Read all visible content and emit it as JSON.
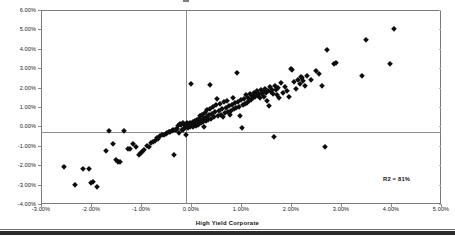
{
  "chart_data": {
    "type": "scatter",
    "title": "",
    "xlabel": "High Yield Corporate",
    "ylabel": "",
    "xlim": [
      -0.03,
      0.05
    ],
    "ylim": [
      -0.04,
      0.06
    ],
    "grid": false,
    "legend": null,
    "marker": "diamond",
    "marker_color": "#0d0d0d",
    "annotations": [
      {
        "text": "R2 = 81%",
        "x": 0.037,
        "y": -0.0295
      }
    ],
    "xticklabels": [
      "-3.00%",
      "-2.00%",
      "-1.00%",
      "0.00%",
      "1.00%",
      "2.00%",
      "3.00%",
      "4.00%",
      "5.00%"
    ],
    "xtickvalues": [
      -0.03,
      -0.02,
      -0.01,
      0.0,
      0.01,
      0.02,
      0.03,
      0.04,
      0.05
    ],
    "yticklabels": [
      "6.00%",
      "5.00%",
      "4.00%",
      "3.00%",
      "2.00%",
      "1.00%",
      "0.00%",
      "-1.00%",
      "-2.00%",
      "-3.00%",
      "-4.00%"
    ],
    "ytickvalues": [
      0.06,
      0.05,
      0.04,
      0.03,
      0.02,
      0.01,
      0.0,
      -0.01,
      -0.02,
      -0.03,
      -0.04
    ],
    "points": [
      [
        -0.0254,
        -0.0207
      ],
      [
        -0.0233,
        -0.0301
      ],
      [
        -0.0216,
        -0.0219
      ],
      [
        -0.0205,
        -0.0222
      ],
      [
        -0.0201,
        -0.0292
      ],
      [
        -0.0196,
        -0.0286
      ],
      [
        -0.0189,
        -0.031
      ],
      [
        -0.0171,
        -0.0126
      ],
      [
        -0.0164,
        -0.0025
      ],
      [
        -0.0157,
        -0.0093
      ],
      [
        -0.0151,
        -0.0175
      ],
      [
        -0.0147,
        -0.0181
      ],
      [
        -0.0142,
        -0.0183
      ],
      [
        -0.0134,
        -0.0024
      ],
      [
        -0.0127,
        -0.0114
      ],
      [
        -0.0122,
        -0.0117
      ],
      [
        -0.0116,
        -0.0093
      ],
      [
        -0.011,
        -0.0107
      ],
      [
        -0.0104,
        -0.0147
      ],
      [
        -0.0101,
        -0.0139
      ],
      [
        -0.0098,
        -0.0131
      ],
      [
        -0.0094,
        -0.012
      ],
      [
        -0.0089,
        -0.01
      ],
      [
        -0.0085,
        -0.0105
      ],
      [
        -0.0081,
        -0.0083
      ],
      [
        -0.0077,
        -0.0079
      ],
      [
        -0.0073,
        -0.0074
      ],
      [
        -0.0069,
        -0.006
      ],
      [
        -0.0066,
        -0.0063
      ],
      [
        -0.0062,
        -0.0052
      ],
      [
        -0.0058,
        -0.0046
      ],
      [
        -0.0055,
        -0.0044
      ],
      [
        -0.0051,
        -0.0039
      ],
      [
        -0.0048,
        -0.0035
      ],
      [
        -0.0045,
        -0.0031
      ],
      [
        -0.0042,
        -0.0029
      ],
      [
        -0.0039,
        -0.0024
      ],
      [
        -0.0036,
        -0.0021
      ],
      [
        -0.0034,
        -0.0148
      ],
      [
        -0.0033,
        -0.0019
      ],
      [
        -0.003,
        -0.0017
      ],
      [
        -0.0028,
        -0.0011
      ],
      [
        -0.0026,
        0.0002
      ],
      [
        -0.0025,
        -0.0034
      ],
      [
        -0.0023,
        0.0012
      ],
      [
        -0.0021,
        0.0006
      ],
      [
        -0.0019,
        -0.0021
      ],
      [
        -0.0017,
        0.0015
      ],
      [
        -0.0016,
        -0.0016
      ],
      [
        -0.0014,
        0.0009
      ],
      [
        -0.0013,
        -0.001
      ],
      [
        -0.0011,
        0.0004
      ],
      [
        -0.001,
        -0.0043
      ],
      [
        -0.0009,
        0.0019
      ],
      [
        -0.0008,
        0.0001
      ],
      [
        -0.0006,
        -0.0007
      ],
      [
        -0.0005,
        0.0011
      ],
      [
        -0.0004,
        0.0003
      ],
      [
        -0.0003,
        0.0016
      ],
      [
        -0.0002,
        -0.0004
      ],
      [
        -0.0001,
        0.0008
      ],
      [
        0.0,
        0.0218
      ],
      [
        0.0001,
        0.0013
      ],
      [
        0.0002,
        0.0002
      ],
      [
        0.0003,
        0.0021
      ],
      [
        0.0004,
        -0.0002
      ],
      [
        0.0005,
        0.0007
      ],
      [
        0.0006,
        0.0017
      ],
      [
        0.0007,
        0.001
      ],
      [
        0.0008,
        0.0026
      ],
      [
        0.0009,
        0.0004
      ],
      [
        0.001,
        0.0014
      ],
      [
        0.0011,
        0.0031
      ],
      [
        0.0012,
        0.0019
      ],
      [
        0.0013,
        0.0006
      ],
      [
        0.0014,
        0.0024
      ],
      [
        0.0015,
        0.004
      ],
      [
        0.0016,
        0.0011
      ],
      [
        0.0017,
        0.0029
      ],
      [
        0.0018,
        0.0052
      ],
      [
        0.0019,
        0.0016
      ],
      [
        0.002,
        0.0035
      ],
      [
        0.0022,
        0.0061
      ],
      [
        0.0023,
        0.0021
      ],
      [
        0.0025,
        0.0043
      ],
      [
        0.0026,
        -0.0004
      ],
      [
        0.0027,
        0.007
      ],
      [
        0.0029,
        0.0027
      ],
      [
        0.0031,
        0.005
      ],
      [
        0.0032,
        0.0085
      ],
      [
        0.0034,
        0.0033
      ],
      [
        0.0036,
        0.0057
      ],
      [
        0.0037,
        0.009
      ],
      [
        0.0038,
        0.0216
      ],
      [
        0.004,
        0.0039
      ],
      [
        0.0042,
        0.0064
      ],
      [
        0.0044,
        0.01
      ],
      [
        0.0046,
        0.0046
      ],
      [
        0.0048,
        0.0073
      ],
      [
        0.005,
        0.0109
      ],
      [
        0.0052,
        0.0141
      ],
      [
        0.0054,
        0.0053
      ],
      [
        0.0056,
        0.0081
      ],
      [
        0.0058,
        0.0116
      ],
      [
        0.006,
        0.006
      ],
      [
        0.0062,
        0.0089
      ],
      [
        0.0064,
        0.0046
      ],
      [
        0.0066,
        0.0124
      ],
      [
        0.0068,
        0.0067
      ],
      [
        0.007,
        0.0097
      ],
      [
        0.0072,
        0.0133
      ],
      [
        0.0074,
        0.0074
      ],
      [
        0.0076,
        0.0105
      ],
      [
        0.0078,
        0.0058
      ],
      [
        0.008,
        0.0081
      ],
      [
        0.0082,
        0.0112
      ],
      [
        0.0084,
        0.0148
      ],
      [
        0.0086,
        0.0088
      ],
      [
        0.0088,
        0.012
      ],
      [
        0.009,
        0.0095
      ],
      [
        0.0092,
        0.0273
      ],
      [
        0.0094,
        0.0127
      ],
      [
        0.0096,
        0.0102
      ],
      [
        0.0098,
        0.0052
      ],
      [
        0.01,
        0.0134
      ],
      [
        0.0102,
        -0.0009
      ],
      [
        0.0104,
        0.0109
      ],
      [
        0.0106,
        0.0141
      ],
      [
        0.0108,
        0.0116
      ],
      [
        0.011,
        0.016
      ],
      [
        0.0112,
        0.0123
      ],
      [
        0.0114,
        0.0148
      ],
      [
        0.0116,
        0.013
      ],
      [
        0.0118,
        0.0167
      ],
      [
        0.012,
        0.0137
      ],
      [
        0.0122,
        0.0155
      ],
      [
        0.0124,
        0.0144
      ],
      [
        0.0126,
        0.0174
      ],
      [
        0.0128,
        0.0151
      ],
      [
        0.013,
        0.0162
      ],
      [
        0.0132,
        0.0181
      ],
      [
        0.0134,
        0.0158
      ],
      [
        0.0136,
        0.0169
      ],
      [
        0.0138,
        0.0145
      ],
      [
        0.014,
        0.0188
      ],
      [
        0.0142,
        0.0165
      ],
      [
        0.0144,
        0.0176
      ],
      [
        0.0146,
        0.0152
      ],
      [
        0.0148,
        0.0195
      ],
      [
        0.015,
        0.0172
      ],
      [
        0.0152,
        0.0129
      ],
      [
        0.0154,
        0.0183
      ],
      [
        0.0156,
        0.0106
      ],
      [
        0.0158,
        0.0202
      ],
      [
        0.016,
        0.0179
      ],
      [
        0.0162,
        0.019
      ],
      [
        0.0164,
        0.0167
      ],
      [
        0.0166,
        -0.0057
      ],
      [
        0.0168,
        0.0209
      ],
      [
        0.017,
        0.0186
      ],
      [
        0.0172,
        0.0163
      ],
      [
        0.0174,
        0.0197
      ],
      [
        0.0176,
        0.0144
      ],
      [
        0.018,
        0.0222
      ],
      [
        0.0184,
        0.017
      ],
      [
        0.0188,
        0.0204
      ],
      [
        0.0192,
        0.0181
      ],
      [
        0.0196,
        0.0151
      ],
      [
        0.02,
        0.0298
      ],
      [
        0.0202,
        0.0292
      ],
      [
        0.0206,
        0.0229
      ],
      [
        0.021,
        0.0193
      ],
      [
        0.0214,
        0.0241
      ],
      [
        0.0218,
        0.0218
      ],
      [
        0.022,
        0.0253
      ],
      [
        0.0222,
        0.0247
      ],
      [
        0.0224,
        0.0235
      ],
      [
        0.0228,
        0.0206
      ],
      [
        0.0232,
        0.0261
      ],
      [
        0.024,
        0.0238
      ],
      [
        0.025,
        0.0285
      ],
      [
        0.0256,
        0.0271
      ],
      [
        0.0262,
        0.0209
      ],
      [
        0.0268,
        -0.0104
      ],
      [
        0.0272,
        0.0396
      ],
      [
        0.0285,
        0.032
      ],
      [
        0.029,
        0.0326
      ],
      [
        0.0342,
        0.0261
      ],
      [
        0.035,
        0.0443
      ],
      [
        0.0398,
        0.0323
      ],
      [
        0.0405,
        0.05
      ]
    ]
  },
  "axis_title": {
    "x": "High Yield Corporate"
  },
  "annotation": {
    "r_squared": "R2 = 81%"
  }
}
